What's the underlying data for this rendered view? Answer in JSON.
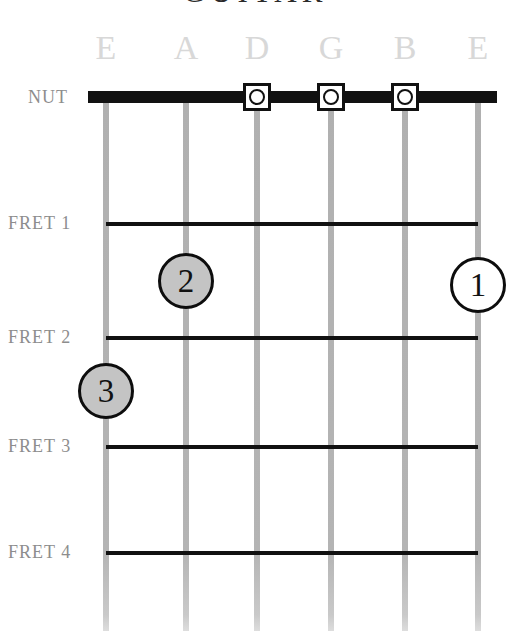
{
  "title": {
    "text": "GUITAR",
    "note": "cropped at top edge"
  },
  "labels": {
    "nut": "NUT",
    "frets": [
      "FRET 1",
      "FRET 2",
      "FRET 3",
      "FRET 4"
    ]
  },
  "strings": [
    {
      "name": "E",
      "x": 106,
      "order": 6
    },
    {
      "name": "A",
      "x": 186,
      "order": 5
    },
    {
      "name": "D",
      "x": 257,
      "order": 4
    },
    {
      "name": "G",
      "x": 331,
      "order": 3
    },
    {
      "name": "B",
      "x": 405,
      "order": 2
    },
    {
      "name": "E",
      "x": 478,
      "order": 1
    }
  ],
  "fret_positions": [
    222,
    336,
    445,
    551
  ],
  "nut_y": 97,
  "open_markers": [
    {
      "string": "D",
      "x": 257,
      "y": 97,
      "symbol": "O"
    },
    {
      "string": "G",
      "x": 331,
      "y": 97,
      "symbol": "O"
    },
    {
      "string": "B",
      "x": 405,
      "y": 97,
      "symbol": "O"
    }
  ],
  "fingers": [
    {
      "number": "2",
      "string": "A",
      "fret": 1,
      "x": 186,
      "y": 281,
      "style": "filled"
    },
    {
      "number": "1",
      "string": "E-high",
      "fret": 1,
      "x": 478,
      "y": 285,
      "style": "hollow"
    },
    {
      "number": "3",
      "string": "E-low",
      "fret": 2,
      "x": 106,
      "y": 391,
      "style": "filled"
    }
  ],
  "colors": {
    "string": "#b2b2b2",
    "fret": "#111111",
    "nut": "#111111",
    "label": "#8d8d8d",
    "string_label": "#d8d8d8",
    "finger_fill": "#c4c4c4",
    "background": "#ffffff"
  }
}
